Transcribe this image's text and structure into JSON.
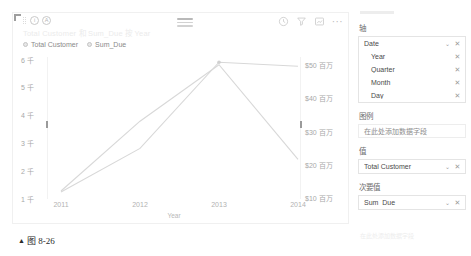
{
  "visual": {
    "title": "Total Customer 和 Sum_Due 按 Year",
    "corner_handle": "resize-handle",
    "header_icons": {
      "drag_dots": "drag-dots-icon",
      "info": "i",
      "accessibility": "A",
      "hamburger": "hamburger-handle-icon",
      "history": "history-icon",
      "filter": "filter-icon",
      "focus": "focus-mode-icon",
      "more": "···"
    },
    "legend": [
      {
        "label": "Total Customer",
        "color": "#c4c4c4"
      },
      {
        "label": "Sum_Due",
        "color": "#c4c4c4"
      }
    ]
  },
  "chart_data": {
    "type": "line",
    "title": "Total Customer 和 Sum_Due 按 Year",
    "xlabel": "Year",
    "ylabel": "",
    "categories": [
      "2011",
      "2012",
      "2013",
      "2014"
    ],
    "x_tick_labels": [
      "2011",
      "2012",
      "2013",
      "2014"
    ],
    "grid": false,
    "legend_position": "top-left",
    "axes": {
      "left": {
        "tick_labels": [
          "6 千",
          "5 千",
          "4 千",
          "3 千",
          "2 千",
          "1 千"
        ],
        "tick_values": [
          6000,
          5000,
          4000,
          3000,
          2000,
          1000
        ],
        "ylim": [
          1000,
          6000
        ],
        "unit": "千"
      },
      "right": {
        "tick_labels": [
          "$50 百万",
          "$40 百万",
          "$30 百万",
          "$20 百万",
          "$10 百万"
        ],
        "tick_values": [
          50000000,
          40000000,
          30000000,
          20000000,
          10000000
        ],
        "ylim": [
          10000000,
          50000000
        ],
        "unit": "百万"
      }
    },
    "series": [
      {
        "name": "Total Customer",
        "axis": "left",
        "color": "#d8d8d8",
        "values": [
          1180,
          2750,
          5850,
          5700
        ]
      },
      {
        "name": "Sum_Due",
        "axis": "right",
        "color": "#d8d8d8",
        "values": [
          11500000,
          32500000,
          49500000,
          21000000
        ]
      }
    ]
  },
  "field_panel": {
    "sections": [
      {
        "label": "轴",
        "type": "fields",
        "items": [
          {
            "name": "Date",
            "indent": false,
            "has_chevron": true,
            "remove": "✕"
          },
          {
            "name": "Year",
            "indent": true,
            "has_chevron": false,
            "remove": "✕"
          },
          {
            "name": "Quarter",
            "indent": true,
            "has_chevron": false,
            "remove": "✕"
          },
          {
            "name": "Month",
            "indent": true,
            "has_chevron": false,
            "remove": "✕"
          },
          {
            "name": "Day",
            "indent": true,
            "has_chevron": false,
            "remove": "✕"
          }
        ]
      },
      {
        "label": "图例",
        "type": "placeholder",
        "placeholder": "在此处添加数据字段"
      },
      {
        "label": "值",
        "type": "fields",
        "items": [
          {
            "name": "Total Customer",
            "indent": false,
            "has_chevron": true,
            "remove": "✕"
          }
        ]
      },
      {
        "label": "次要值",
        "type": "fields",
        "items": [
          {
            "name": "Sum_Due",
            "indent": false,
            "has_chevron": true,
            "remove": "✕"
          }
        ]
      }
    ],
    "bottom_ghost_text": "在此处添加数据字段"
  },
  "caption": {
    "marker": "▲",
    "text": "图 8-26"
  }
}
